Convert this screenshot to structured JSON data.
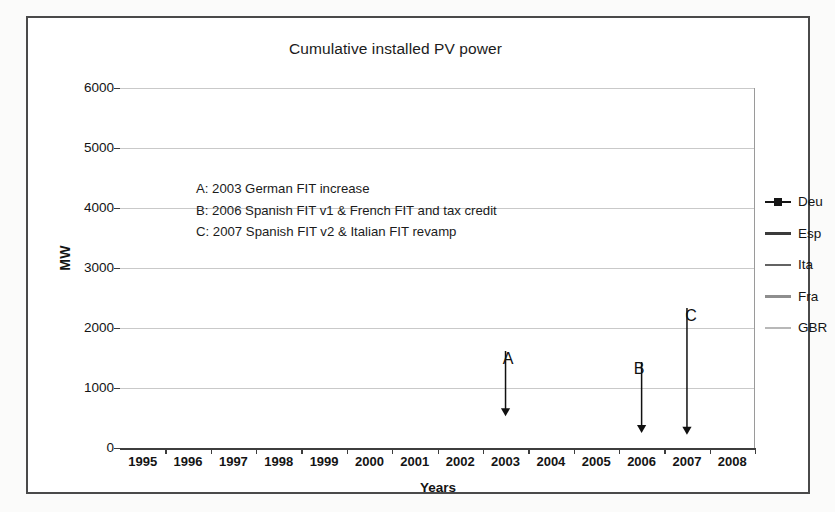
{
  "chart_data": {
    "type": "line",
    "title": "Cumulative installed PV power",
    "xlabel": "Years",
    "ylabel": "MW",
    "x": [
      1995,
      1996,
      1997,
      1998,
      1999,
      2000,
      2001,
      2002,
      2003,
      2004,
      2005,
      2006,
      2007,
      2008
    ],
    "categories": [
      "1995",
      "1996",
      "1997",
      "1998",
      "1999",
      "2000",
      "2001",
      "2002",
      "2003",
      "2004",
      "2005",
      "2006",
      "2007",
      "2008"
    ],
    "ylim": [
      0,
      6000
    ],
    "yticks": [
      0,
      1000,
      2000,
      3000,
      4000,
      5000,
      6000
    ],
    "ytick_labels": [
      "0",
      "1000",
      "2000",
      "3000",
      "4000",
      "5000",
      "6000"
    ],
    "grid": true,
    "legend_position": "right",
    "series": [
      {
        "name": "Deu",
        "color": "#151515",
        "marker": "square",
        "values": [
          20,
          28,
          42,
          55,
          70,
          115,
          195,
          280,
          430,
          1030,
          1910,
          2750,
          3840,
          5340
        ]
      },
      {
        "name": "Esp",
        "color": "#3b3b3b",
        "marker": "none",
        "values": [
          1,
          2,
          3,
          5,
          8,
          12,
          16,
          21,
          28,
          40,
          60,
          150,
          800,
          3380
        ]
      },
      {
        "name": "Ita",
        "color": "#636363",
        "marker": "none",
        "values": [
          14,
          16,
          17,
          18,
          19,
          20,
          21,
          22,
          26,
          31,
          38,
          50,
          120,
          460
        ]
      },
      {
        "name": "Fra",
        "color": "#8e8e8e",
        "marker": "none",
        "values": [
          2,
          3,
          4,
          6,
          8,
          11,
          14,
          17,
          21,
          26,
          33,
          44,
          75,
          180
        ]
      },
      {
        "name": "GBR",
        "color": "#b8b8b8",
        "marker": "none",
        "values": [
          1,
          1,
          2,
          2,
          3,
          4,
          5,
          6,
          8,
          11,
          14,
          17,
          20,
          23
        ]
      }
    ],
    "annotations": [
      {
        "id": "A",
        "text": "A: 2003 German FIT increase"
      },
      {
        "id": "B",
        "text": "B: 2006 Spanish FIT v1 & French FIT and tax credit"
      },
      {
        "id": "C",
        "text": "C: 2007 Spanish FIT v2 & Italian FIT revamp"
      }
    ],
    "callouts": [
      {
        "label": "A",
        "year": 2003,
        "points_to_value": 430
      },
      {
        "label": "B",
        "year": 2006,
        "points_to_value": 150
      },
      {
        "label": "C",
        "year": 2007,
        "points_to_value": 120
      }
    ],
    "reference_line": {
      "year": 2008,
      "style": "dashed",
      "color": "#a0a0a0"
    }
  }
}
